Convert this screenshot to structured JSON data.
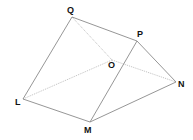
{
  "diagram": {
    "type": "3d-prism-wireframe",
    "vertices": {
      "Q": {
        "label": "Q",
        "x": 72,
        "y": 17,
        "lx": 67,
        "ly": 13
      },
      "P": {
        "label": "P",
        "x": 137,
        "y": 41,
        "lx": 137,
        "ly": 37
      },
      "O": {
        "label": "O",
        "x": 112,
        "y": 60,
        "lx": 108,
        "ly": 68
      },
      "N": {
        "label": "N",
        "x": 176,
        "y": 82,
        "lx": 178,
        "ly": 87
      },
      "L": {
        "label": "L",
        "x": 23,
        "y": 99,
        "lx": 15,
        "ly": 105
      },
      "M": {
        "label": "M",
        "x": 90,
        "y": 122,
        "lx": 84,
        "ly": 133
      }
    },
    "solid_edges": [
      [
        "Q",
        "L"
      ],
      [
        "L",
        "M"
      ],
      [
        "M",
        "N"
      ],
      [
        "N",
        "P"
      ],
      [
        "P",
        "Q"
      ],
      [
        "P",
        "M"
      ]
    ],
    "hidden_edges": [
      [
        "Q",
        "O"
      ],
      [
        "L",
        "O"
      ],
      [
        "O",
        "N"
      ]
    ],
    "colors": {
      "solid": "#8a8a8a",
      "hidden": "#b8b8b8",
      "label": "#111111"
    }
  }
}
